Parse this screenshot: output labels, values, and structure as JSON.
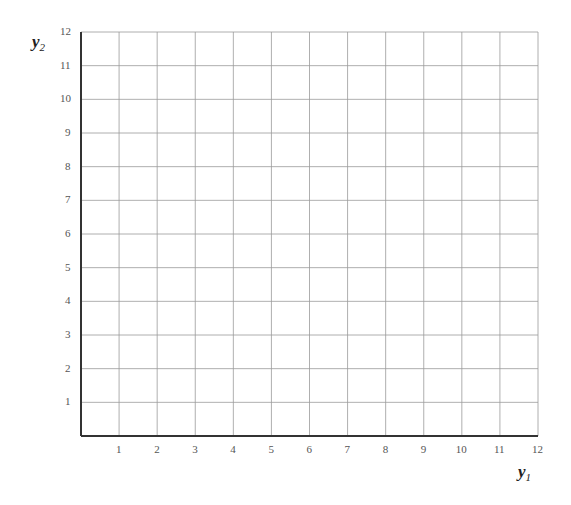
{
  "chart_data": {
    "type": "scatter",
    "title": "",
    "xlabel": "y1",
    "ylabel": "y2",
    "x_ticks": [
      1,
      2,
      3,
      4,
      5,
      6,
      7,
      8,
      9,
      10,
      11,
      12
    ],
    "y_ticks": [
      1,
      2,
      3,
      4,
      5,
      6,
      7,
      8,
      9,
      10,
      11,
      12
    ],
    "xlim": [
      0,
      12
    ],
    "ylim": [
      0,
      12
    ],
    "grid": true,
    "series": [],
    "legend": null
  },
  "axes": {
    "x_label_main": "y",
    "x_label_sub": "1",
    "y_label_main": "y",
    "y_label_sub": "2"
  },
  "colors": {
    "grid": "#9a9a9a",
    "axis": "#333333",
    "tick_text": "#555555"
  }
}
